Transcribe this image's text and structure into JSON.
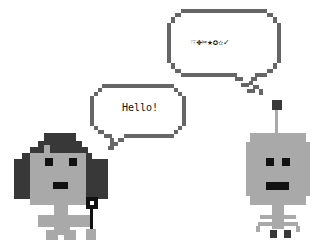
{
  "scene": {
    "left_character": {
      "name": "girl",
      "speech": "Hello!"
    },
    "right_character": {
      "name": "robot",
      "speech": "☞✥✂★✪✫✓"
    }
  }
}
